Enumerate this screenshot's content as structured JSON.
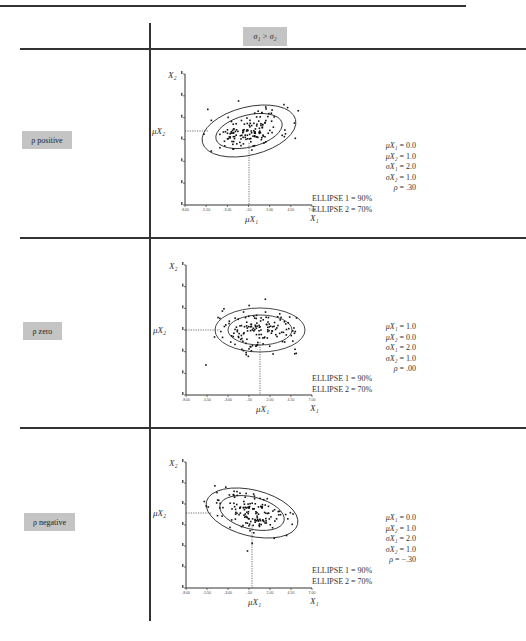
{
  "header": {
    "column_label": "σ₁ > σ₂"
  },
  "rows": [
    {
      "label": "ρ positive",
      "params": [
        {
          "name": "μX₁",
          "value": "= 0.0"
        },
        {
          "name": "μX₂",
          "value": "= 1.0"
        },
        {
          "name": "σX₁",
          "value": "= 2.0"
        },
        {
          "name": "σX₂",
          "value": "= 1.0"
        },
        {
          "name": "ρ",
          "value": "= .30"
        }
      ],
      "ellipse1": "ELLIPSE 1 = 90%",
      "ellipse2": "ELLIPSE 2 = 70%"
    },
    {
      "label": "ρ zero",
      "params": [
        {
          "name": "μX₁",
          "value": "= 1.0"
        },
        {
          "name": "μX₂",
          "value": "= 0.0"
        },
        {
          "name": "σX₁",
          "value": "= 2.0"
        },
        {
          "name": "σX₂",
          "value": "= 1.0"
        },
        {
          "name": "ρ",
          "value": "= .00"
        }
      ],
      "ellipse1": "ELLIPSE 1 = 90%",
      "ellipse2": "ELLIPSE 2 = 70%"
    },
    {
      "label": "ρ negative",
      "params": [
        {
          "name": "μX₁",
          "value": "= 0.0"
        },
        {
          "name": "μX₂",
          "value": "= 1.0"
        },
        {
          "name": "σX₁",
          "value": "= 2.0"
        },
        {
          "name": "σX₂",
          "value": "= 1.0"
        },
        {
          "name": "ρ",
          "value": "= −.30"
        }
      ],
      "ellipse1": "ELLIPSE 1 = 90%",
      "ellipse2": "ELLIPSE 2 = 70%"
    }
  ],
  "axes": {
    "x_label": "X₁",
    "y_label": "X₂",
    "mu_x_label": "μX₁",
    "mu_y_label": "μX₂",
    "x_ticks": [
      "-8.00",
      "-5.50",
      "-3.00",
      "-.50",
      "2.00",
      "4.50",
      "7.00"
    ]
  },
  "colors": {
    "label_box": "#c4c4c4",
    "rule": "#333333"
  }
}
